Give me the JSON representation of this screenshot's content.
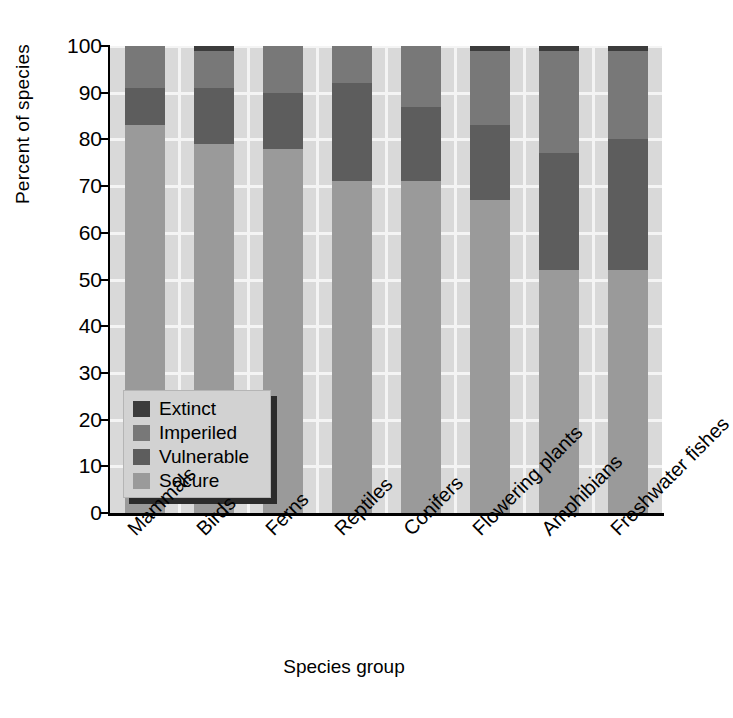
{
  "chart_data": {
    "type": "bar",
    "subtype": "stacked-bar-percent",
    "title": "",
    "xlabel": "Species group",
    "ylabel": "Percent of species",
    "ylim": [
      0,
      100
    ],
    "yticks": [
      0,
      10,
      20,
      30,
      40,
      50,
      60,
      70,
      80,
      90,
      100
    ],
    "ytick_labels": [
      "0",
      "10",
      "20",
      "30",
      "40",
      "50",
      "60",
      "70",
      "80",
      "90",
      "100"
    ],
    "grid": "horizontal-and-vertical white gridlines on gray panel",
    "legend_position": "inside lower-left of plot area",
    "stack_order_bottom_to_top": [
      "Secure",
      "Vulnerable",
      "Imperiled",
      "Extinct"
    ],
    "categories": [
      "Mammals",
      "Birds",
      "Ferns",
      "Reptiles",
      "Conifers",
      "Flowering plants",
      "Amphibians",
      "Freshwater fishes"
    ],
    "series": [
      {
        "name": "Secure",
        "color": "#9a9a9a",
        "values": [
          83,
          79,
          78,
          71,
          71,
          67,
          52,
          52
        ]
      },
      {
        "name": "Vulnerable",
        "color": "#5d5d5d",
        "values": [
          8,
          12,
          12,
          21,
          16,
          16,
          25,
          28
        ]
      },
      {
        "name": "Imperiled",
        "color": "#787878",
        "values": [
          9,
          8,
          10,
          8,
          13,
          16,
          22,
          19
        ]
      },
      {
        "name": "Extinct",
        "color": "#3c3c3c",
        "values": [
          0,
          1,
          0,
          0,
          0,
          1,
          1,
          1
        ]
      }
    ]
  },
  "legend": {
    "items": [
      {
        "label": "Extinct",
        "color": "#3c3c3c"
      },
      {
        "label": "Imperiled",
        "color": "#787878"
      },
      {
        "label": "Vulnerable",
        "color": "#5d5d5d"
      },
      {
        "label": "Secure",
        "color": "#9a9a9a"
      }
    ]
  },
  "axes": {
    "y_title": "Percent of species",
    "x_title": "Species group"
  },
  "colors": {
    "panel_background": "#d9d9d9",
    "gridline": "#f4f4f4",
    "axis": "#000000",
    "figure_background": "#ffffff",
    "legend_background": "#d2d2d2",
    "legend_shadow": "#2b2b2b"
  }
}
